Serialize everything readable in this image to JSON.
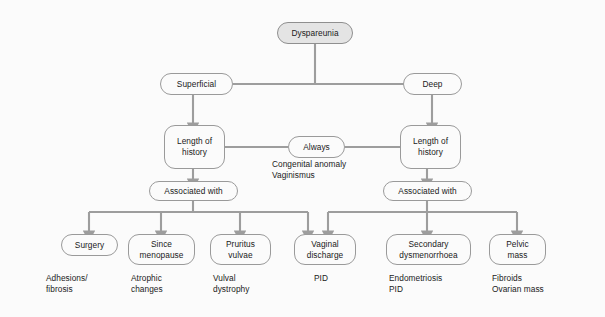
{
  "diagram": {
    "colors": {
      "background": "#fbfbfb",
      "node_border": "#9a9a9a",
      "node_fill": "#fbfbfb",
      "root_fill": "#e4e4e4",
      "connector": "#9d9d9d",
      "text": "#1a1a1a"
    },
    "nodes": {
      "root": "Dyspareunia",
      "superficial": "Superficial",
      "deep": "Deep",
      "length_of_history_left": "Length of\nhistory",
      "length_of_history_right": "Length of\nhistory",
      "always": "Always",
      "associated_with_left": "Associated with",
      "associated_with_right": "Associated with",
      "surgery": "Surgery",
      "since_menopause": "Since\nmenopause",
      "pruritus_vulvae": "Pruritus\nvulvae",
      "vaginal_discharge": "Vaginal\ndischarge",
      "secondary_dysmenorrhoea": "Secondary\ndysmenorrhoea",
      "pelvic_mass": "Pelvic\nmass"
    },
    "captions": {
      "always_causes": "Congenital anomaly\nVaginismus",
      "surgery_causes": "Adhesions/\nfibrosis",
      "since_menopause_causes": "Atrophic\nchanges",
      "pruritus_vulvae_causes": "Vulval\ndystrophy",
      "vaginal_discharge_causes": "PID",
      "secondary_dysmenorrhoea_causes": "Endometriosis\nPID",
      "pelvic_mass_causes": "Fibroids\nOvarian mass"
    }
  }
}
